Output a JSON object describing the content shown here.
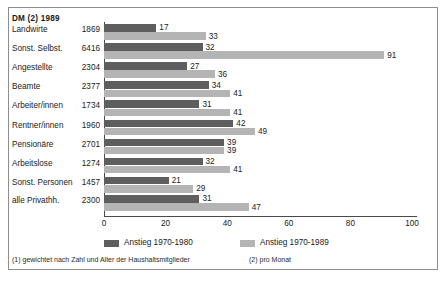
{
  "header": {
    "column_title": "DM (2) 1989"
  },
  "legend": {
    "items": [
      {
        "label": "Anstieg 1970-1980",
        "color": "#5e5e5e",
        "swatch": "dark"
      },
      {
        "label": "Anstieg 1970-1989",
        "color": "#b4b4b4",
        "swatch": "light"
      }
    ]
  },
  "footnotes": {
    "note1": "(1) gewichtet nach Zahl und Alter der Haushaltsmitglieder",
    "note2": "(2) pro Monat"
  },
  "caption": "",
  "chart_data": {
    "type": "bar",
    "orientation": "horizontal",
    "title": "",
    "xlabel": "",
    "ylabel": "",
    "xlim": [
      0,
      100
    ],
    "xticks": [
      0,
      20,
      40,
      60,
      80,
      100
    ],
    "grid": false,
    "legend_position": "bottom",
    "value_column_header": "DM (2) 1989",
    "categories": [
      "Landwirte",
      "Sonst. Selbst.",
      "Angestellte",
      "Beamte",
      "Arbeiter/innen",
      "Rentner/innen",
      "Pensionäre",
      "Arbeitslose",
      "Sonst. Personen"
    ],
    "value_column": [
      1869,
      6416,
      2304,
      2377,
      1734,
      1960,
      2701,
      1274,
      1457
    ],
    "series": [
      {
        "name": "Anstieg 1970-1980",
        "color": "#5e5e5e",
        "values": [
          17,
          32,
          27,
          34,
          31,
          42,
          39,
          32,
          21
        ]
      },
      {
        "name": "Anstieg 1970-1989",
        "color": "#b4b4b4",
        "values": [
          33,
          91,
          36,
          41,
          41,
          49,
          39,
          41,
          29
        ]
      }
    ],
    "summary_row": {
      "category": "alle Privathh.",
      "value_column": 2300,
      "series_values": [
        31,
        47
      ]
    }
  }
}
